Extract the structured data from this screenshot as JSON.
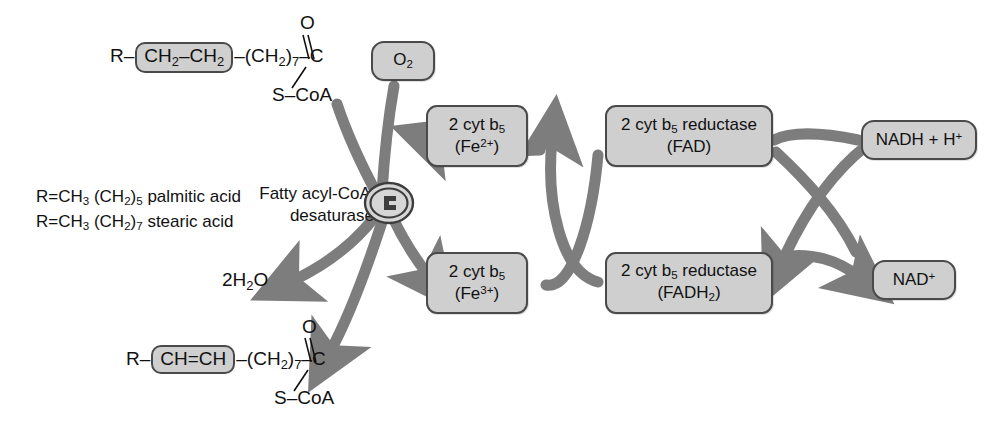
{
  "diagram": {
    "colors": {
      "node_fill": "#cfcfcf",
      "node_stroke": "#4a4a4a",
      "arrow": "#7d7d7d",
      "text": "#111111",
      "background": "#ffffff"
    }
  },
  "substrate": {
    "prefix": "R–",
    "highlight": "CH2–CH2",
    "chain": "–(CH2)7–",
    "carbon": "C",
    "oxygen": "O",
    "thioester": "S–CoA"
  },
  "product": {
    "prefix": "R–",
    "highlight": "CH=CH",
    "chain": "–(CH2)7–",
    "carbon": "C",
    "oxygen": "O",
    "thioester": "S–CoA"
  },
  "r_definitions": [
    {
      "formula": "R=CH3 (CH2)5",
      "name": "palmitic acid"
    },
    {
      "formula": "R=CH3 (CH2)7",
      "name": "stearic acid"
    }
  ],
  "enzyme": {
    "line1": "Fatty acyl-CoA",
    "line2": "desaturase",
    "glyph": "enzyme-oval-icon"
  },
  "nodes": {
    "o2": {
      "label": "O2"
    },
    "water": {
      "label": "2H2O"
    },
    "cyt_b5_reduced": {
      "line1": "2 cyt b5",
      "line2": "(Fe2+)"
    },
    "cyt_b5_oxidized": {
      "line1": "2 cyt b5",
      "line2": "(Fe3+)"
    },
    "reductase_fad": {
      "line1": "2 cyt b5 reductase",
      "line2": "(FAD)"
    },
    "reductase_fadh2": {
      "line1": "2 cyt b5 reductase",
      "line2": "(FADH2)"
    },
    "nadh": {
      "label": "NADH + H+"
    },
    "nad": {
      "label": "NAD+"
    }
  }
}
